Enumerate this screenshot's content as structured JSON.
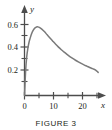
{
  "figure": {
    "caption": "FIGURE 3"
  },
  "axes": {
    "y_axis_label": "y",
    "x_axis_label": "x",
    "y_tick_labels": [
      "0.2",
      "0.4",
      "0.6"
    ],
    "y_tick_values": [
      0.2,
      0.4,
      0.6
    ],
    "y_minor_tick_values": [
      0.1,
      0.3,
      0.5
    ],
    "x_tick_labels": [
      "0",
      "10",
      "20"
    ],
    "x_tick_values": [
      0,
      10,
      20
    ],
    "x_minor_tick_values": [
      5,
      15,
      25
    ]
  },
  "colors": {
    "axis": "#4d4d4d",
    "curve": "#7a7a7a",
    "text": "#231f20",
    "background": "#ffffff"
  },
  "chart_data": {
    "type": "line",
    "title": "",
    "subtitle": "",
    "xlabel": "x",
    "ylabel": "y",
    "xlim": [
      0,
      27
    ],
    "ylim": [
      0,
      0.68
    ],
    "grid": false,
    "legend": null,
    "annotations": [],
    "series": [
      {
        "name": "density curve",
        "x": [
          0.0,
          0.4,
          0.8,
          1.2,
          1.6,
          2.0,
          2.5,
          3.0,
          3.5,
          4.0,
          4.5,
          5.0,
          5.5,
          6.0,
          7.0,
          8.0,
          9.0,
          10.0,
          11.0,
          12.0,
          13.0,
          14.0,
          15.0,
          16.0,
          17.0,
          18.0,
          19.0,
          20.0,
          21.0,
          22.0,
          23.0,
          24.0,
          25.0,
          26.0
        ],
        "y": [
          0.0,
          0.21,
          0.33,
          0.4,
          0.45,
          0.485,
          0.522,
          0.548,
          0.566,
          0.576,
          0.58,
          0.578,
          0.572,
          0.563,
          0.54,
          0.513,
          0.486,
          0.459,
          0.433,
          0.409,
          0.387,
          0.366,
          0.347,
          0.329,
          0.313,
          0.298,
          0.284,
          0.271,
          0.259,
          0.248,
          0.237,
          0.227,
          0.217,
          0.195
        ]
      }
    ]
  }
}
